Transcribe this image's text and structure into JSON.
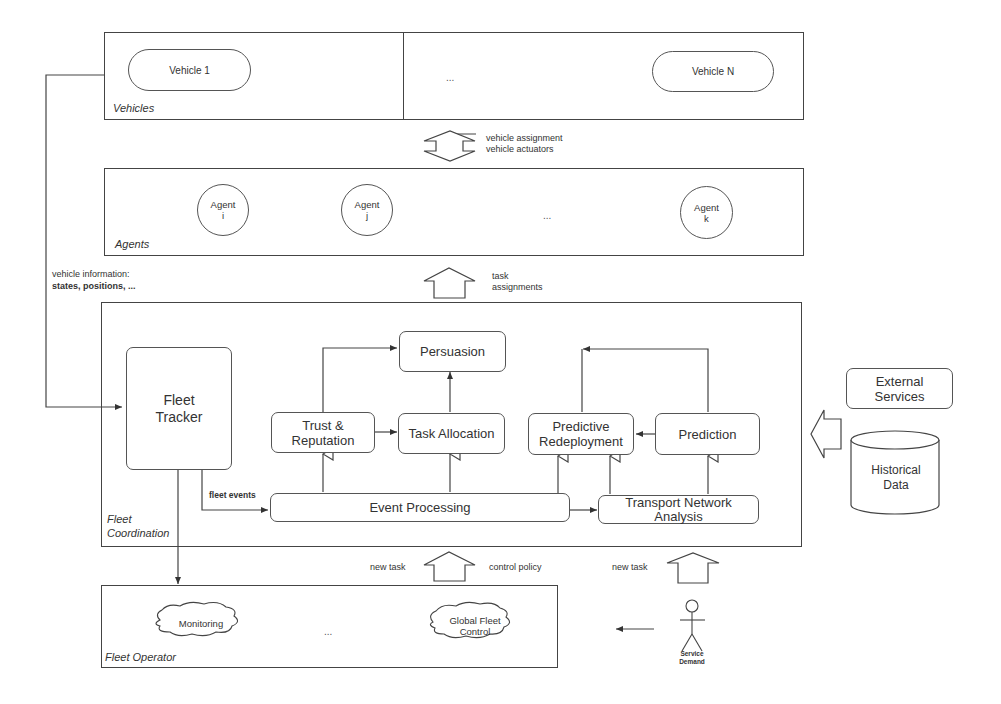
{
  "layers": {
    "vehicles": {
      "label": "Vehicles",
      "items": [
        {
          "label": "Vehicle 1"
        },
        {
          "label": "Vehicle N"
        }
      ],
      "ellipsis": "..."
    },
    "agents": {
      "label": "Agents",
      "items": [
        {
          "label": "Agent\ni"
        },
        {
          "label": "Agent\nj"
        },
        {
          "label": "Agent\nk"
        }
      ],
      "ellipsis": "..."
    },
    "fleet_coordination": {
      "label": "Fleet\nCoordination",
      "nodes": {
        "fleet_tracker": "Fleet\nTracker",
        "persuasion": "Persuasion",
        "trust_reputation": "Trust &\nReputation",
        "task_allocation": "Task Allocation",
        "predictive_redeployment": "Predictive\nRedeployment",
        "prediction": "Prediction",
        "event_processing": "Event Processing",
        "transport_network_analysis": "Transport Network\nAnalysis"
      },
      "edge_labels": {
        "fleet_events": "fleet events"
      }
    },
    "fleet_operator": {
      "label": "Fleet Operator",
      "items": [
        {
          "label": "Monitoring"
        },
        {
          "label": "Global Fleet\nControl"
        }
      ],
      "ellipsis": "..."
    }
  },
  "external": {
    "external_services": "External\nServices",
    "historical_data": "Historical\nData",
    "service_demand": "Service\nDemand"
  },
  "flows": {
    "vehicle_link": "vehicle assignment\nvehicle actuators",
    "task_assignments": "task\nassignments",
    "vehicle_information_title": "vehicle information:",
    "vehicle_information_detail": "states, positions, ...",
    "new_task_left": "new task",
    "control_policy": "control policy",
    "new_task_right": "new task"
  }
}
